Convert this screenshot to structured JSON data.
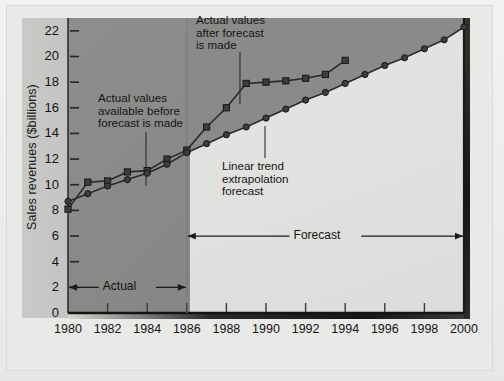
{
  "chart_data": {
    "type": "line",
    "title": "",
    "xlabel": "",
    "ylabel": "Sales revenues ($billions)",
    "xlim": [
      1980,
      2000
    ],
    "ylim": [
      0,
      23
    ],
    "ytick_step": 2,
    "xtick_step": 2,
    "grid": false,
    "legend": "none",
    "xticks": [
      "1980",
      "1982",
      "1984",
      "1986",
      "1988",
      "1990",
      "1992",
      "1994",
      "1996",
      "1998",
      "2000"
    ],
    "yticks": [
      "0",
      "2",
      "4",
      "6",
      "8",
      "10",
      "12",
      "14",
      "16",
      "18",
      "20",
      "22"
    ],
    "forecast_origin_year": 1986,
    "series": [
      {
        "name": "Actual values",
        "marker": "square",
        "x": [
          1980,
          1981,
          1982,
          1983,
          1984,
          1985,
          1986,
          1987,
          1988,
          1989,
          1990,
          1991,
          1992,
          1993,
          1994
        ],
        "values": [
          8.1,
          10.2,
          10.3,
          11.0,
          11.1,
          12.0,
          12.7,
          14.5,
          16.0,
          17.9,
          18.0,
          18.1,
          18.3,
          18.6,
          19.7
        ]
      },
      {
        "name": "Linear trend extrapolation forecast",
        "marker": "circle",
        "x": [
          1980,
          1981,
          1982,
          1983,
          1984,
          1985,
          1986,
          1987,
          1988,
          1989,
          1990,
          1991,
          1992,
          1993,
          1994,
          1995,
          1996,
          1997,
          1998,
          1999,
          2000
        ],
        "values": [
          8.7,
          9.3,
          9.9,
          10.4,
          10.9,
          11.6,
          12.5,
          13.2,
          13.9,
          14.5,
          15.2,
          15.9,
          16.6,
          17.2,
          17.9,
          18.6,
          19.3,
          19.9,
          20.6,
          21.3,
          22.3
        ]
      }
    ],
    "annotations": [
      {
        "name": "actual-before-forecast",
        "text_lines": [
          "Actual values",
          "available before",
          "forecast is made"
        ]
      },
      {
        "name": "actual-after-forecast",
        "text_lines": [
          "Actual values",
          "after forecast",
          "is made"
        ]
      },
      {
        "name": "linear-trend",
        "text_lines": [
          "Linear trend",
          "extrapolation",
          "forecast"
        ]
      }
    ],
    "range_labels": [
      {
        "name": "actual-range",
        "label": "Actual",
        "from_year": 1980,
        "to_year": 1986,
        "at_value": 2
      },
      {
        "name": "forecast-range",
        "label": "Forecast",
        "from_year": 1986,
        "to_year": 2000,
        "at_value": 6
      }
    ],
    "colors": {
      "historical_zone": "#8a8a88",
      "forecast_zone": "#e0e0de",
      "series_line": "#2b2b2b",
      "marker_fill": "#3d3d3d",
      "text": "#151515"
    }
  }
}
